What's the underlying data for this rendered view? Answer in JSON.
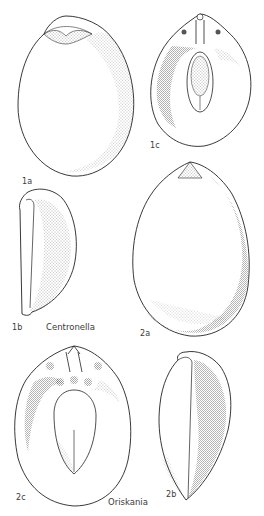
{
  "plate": {
    "figures": [
      {
        "id": "1a",
        "label": "1a",
        "genus": "Centronella",
        "view": "dorsal"
      },
      {
        "id": "1b",
        "label": "1b",
        "genus": "Centronella",
        "view": "lateral"
      },
      {
        "id": "1c",
        "label": "1c",
        "genus": "Centronella",
        "view": "interior"
      },
      {
        "id": "2a",
        "label": "2a",
        "genus": "Oriskania",
        "view": "dorsal"
      },
      {
        "id": "2b",
        "label": "2b",
        "genus": "Oriskania",
        "view": "lateral"
      },
      {
        "id": "2c",
        "label": "2c",
        "genus": "Oriskania",
        "view": "interior"
      }
    ],
    "genera": {
      "centronella": "Centronella",
      "oriskania": "Oriskania"
    }
  }
}
